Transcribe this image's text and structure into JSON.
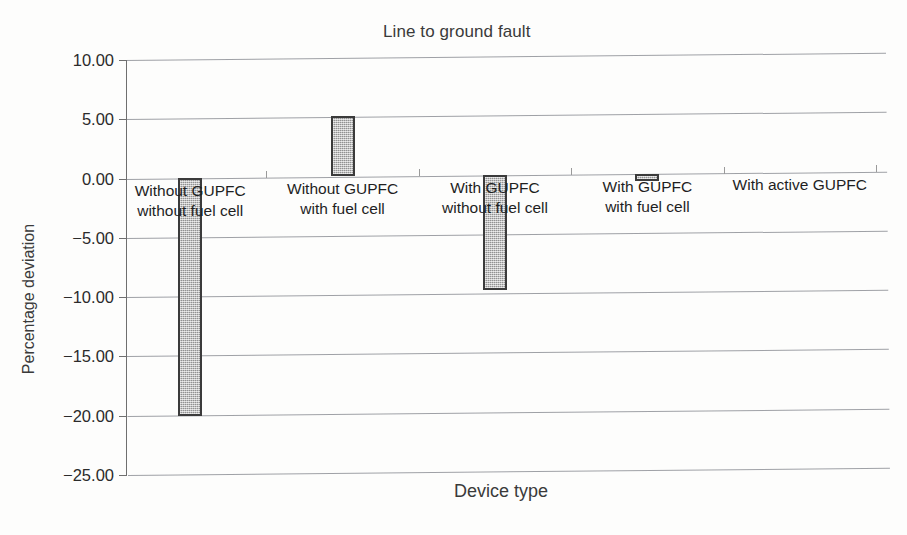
{
  "chart_data": {
    "type": "bar",
    "title": "Line to ground fault",
    "xlabel": "Device type",
    "ylabel": "Percentage deviation",
    "categories": [
      "Without GUPFC without fuel cell",
      "Without GUPFC with fuel cell",
      "With GUPFC without fuel cell",
      "With GUPFC with fuel cell",
      "With active GUPFC"
    ],
    "category_lines": [
      [
        "Without GUPFC",
        "without fuel cell"
      ],
      [
        "Without GUPFC",
        "with fuel cell"
      ],
      [
        "With GUPFC",
        "without fuel cell"
      ],
      [
        "With GUPFC",
        "with fuel cell"
      ],
      [
        "With active GUPFC",
        ""
      ]
    ],
    "values": [
      -20.1,
      5.1,
      -9.7,
      -0.6,
      0.0
    ],
    "ylim": [
      -25.0,
      10.0
    ],
    "yticks": [
      10.0,
      5.0,
      0.0,
      -5.0,
      -10.0,
      -15.0,
      -20.0,
      -25.0
    ],
    "ytick_labels": [
      "10.00",
      "5.00",
      "0.00",
      "−5.00",
      "−10.00",
      "−15.00",
      "−20.00",
      "−25.00"
    ],
    "grid": true,
    "legend": "none",
    "bar_fill_color": "#b9b9b9",
    "bar_edge_color": "#3b3b3b",
    "gridline_color": "#8e9196",
    "background_color": "#ffffff"
  }
}
